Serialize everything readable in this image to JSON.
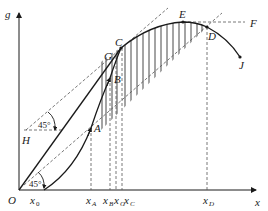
{
  "diagram": {
    "type": "economic-growth / production-function diagram",
    "axes": {
      "y_label": "g",
      "x_label": "x",
      "origin_label": "O"
    },
    "points": {
      "A": "A",
      "B": "B",
      "C": "C",
      "G": "G",
      "E": "E",
      "D": "D",
      "F": "F",
      "J": "J",
      "H": "H"
    },
    "x_ticks": [
      {
        "base": "x",
        "sub": "0"
      },
      {
        "base": "x",
        "sub": "A"
      },
      {
        "base": "x",
        "sub": "B"
      },
      {
        "base": "x",
        "sub": "G"
      },
      {
        "base": "x",
        "sub": "C"
      },
      {
        "base": "x",
        "sub": "D"
      }
    ],
    "angles": {
      "upper": "45°",
      "lower": "45°"
    },
    "colors": {
      "line": "#1a1a1a",
      "dashed": "#555555",
      "background": "#ffffff"
    }
  }
}
